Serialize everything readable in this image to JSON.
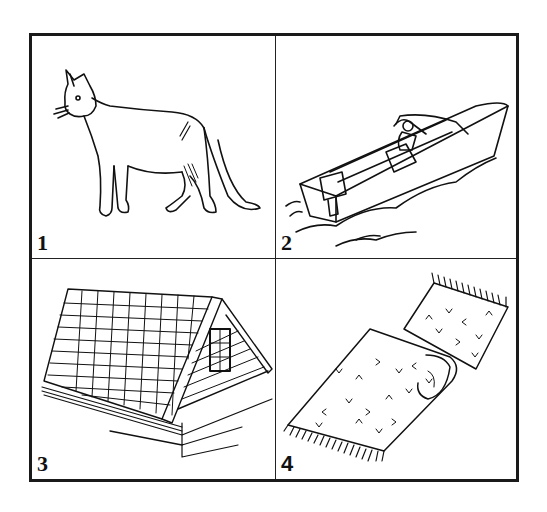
{
  "figure": {
    "layout": "2x2 grid",
    "panels": [
      {
        "label": "1",
        "subject": "cat",
        "description": "Line drawing of a standing cat facing left"
      },
      {
        "label": "2",
        "subject": "motorboat",
        "description": "Line drawing of a motorboat with outboard motor and a person, moving through water"
      },
      {
        "label": "3",
        "subject": "shingled roof",
        "description": "Line drawing of a shingled house roof with a gable and window"
      },
      {
        "label": "4",
        "subject": "rug",
        "description": "Line drawing of a partially rolled fringed rug with V-pattern"
      }
    ],
    "colors": {
      "line": "#111111",
      "background": "#ffffff"
    }
  }
}
